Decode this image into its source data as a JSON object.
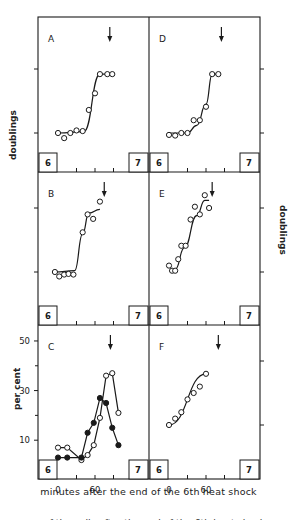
{
  "figure": {
    "y_label_left_top": "doublings",
    "y_label_right": "doublings",
    "y_label_left_bottom": "per cent",
    "x_axis_title": "minutes after the end of the 6th heat shock",
    "caption_fragment": "...rs of the cells after the end of the 6th heat shock..."
  },
  "chart_data": [
    {
      "panel": "A",
      "type": "scatter",
      "col": 0,
      "row": 0,
      "ylabel": "doublings",
      "interval_start_label": "6",
      "interval_end_label": "7",
      "arrow_x": 84,
      "series": [
        {
          "name": "open",
          "marker": "open",
          "points": [
            [
              0,
              0
            ],
            [
              10,
              -0.08
            ],
            [
              20,
              0
            ],
            [
              30,
              0.04
            ],
            [
              40,
              0.03
            ],
            [
              50,
              0.36
            ],
            [
              60,
              0.62
            ],
            [
              68,
              0.92
            ],
            [
              80,
              0.92
            ],
            [
              88,
              0.92
            ]
          ],
          "curve": [
            [
              0,
              0
            ],
            [
              42,
              0.02
            ],
            [
              68,
              0.92
            ],
            [
              88,
              0.92
            ]
          ]
        }
      ],
      "yticks_doublings": [
        0,
        1
      ]
    },
    {
      "panel": "D",
      "type": "scatter",
      "col": 1,
      "row": 0,
      "ylabel": "doublings",
      "interval_start_label": "6",
      "interval_end_label": "7",
      "arrow_x": 85,
      "series": [
        {
          "name": "open",
          "marker": "open",
          "points": [
            [
              0,
              -0.03
            ],
            [
              10,
              -0.04
            ],
            [
              20,
              0
            ],
            [
              30,
              0
            ],
            [
              40,
              0.2
            ],
            [
              50,
              0.2
            ],
            [
              60,
              0.41
            ],
            [
              70,
              0.92
            ],
            [
              80,
              0.92
            ]
          ],
          "curve": [
            [
              0,
              0
            ],
            [
              30,
              0
            ],
            [
              45,
              0.12
            ],
            [
              60,
              0.45
            ],
            [
              70,
              0.92
            ],
            [
              80,
              0.92
            ]
          ]
        }
      ]
    },
    {
      "panel": "B",
      "type": "scatter",
      "col": 0,
      "row": 1,
      "ylabel": "doublings",
      "interval_start_label": "6",
      "interval_end_label": "7",
      "arrow_x": 75,
      "series": [
        {
          "name": "open",
          "marker": "open",
          "points": [
            [
              -5,
              0
            ],
            [
              2,
              -0.07
            ],
            [
              10,
              -0.04
            ],
            [
              17,
              -0.03
            ],
            [
              25,
              -0.04
            ],
            [
              40,
              0.62
            ],
            [
              48,
              0.9
            ],
            [
              57,
              0.83
            ],
            [
              68,
              1.1
            ]
          ],
          "curve": [
            [
              -5,
              0
            ],
            [
              27,
              0.02
            ],
            [
              40,
              0.6
            ],
            [
              50,
              0.92
            ],
            [
              68,
              0.98
            ]
          ]
        }
      ]
    },
    {
      "panel": "E",
      "type": "scatter",
      "col": 1,
      "row": 1,
      "ylabel": "doublings",
      "interval_start_label": "6",
      "interval_end_label": "7",
      "arrow_x": 70,
      "series": [
        {
          "name": "open",
          "marker": "open",
          "points": [
            [
              0,
              0.1
            ],
            [
              5,
              0.02
            ],
            [
              10,
              0.02
            ],
            [
              15,
              0.2
            ],
            [
              20,
              0.41
            ],
            [
              27,
              0.41
            ],
            [
              35,
              0.82
            ],
            [
              42,
              1.02
            ],
            [
              50,
              0.9
            ],
            [
              58,
              1.2
            ],
            [
              65,
              1.0
            ]
          ],
          "curve": [
            [
              0,
              0.02
            ],
            [
              10,
              0.04
            ],
            [
              25,
              0.38
            ],
            [
              45,
              0.88
            ],
            [
              58,
              1.12
            ],
            [
              65,
              1.12
            ]
          ]
        }
      ]
    },
    {
      "panel": "C",
      "type": "line",
      "col": 0,
      "row": 2,
      "ylabel": "per cent",
      "interval_start_label": "6",
      "interval_end_label": "7",
      "arrow_x": 85,
      "yticks": [
        10,
        30,
        50
      ],
      "ylim": [
        0,
        54
      ],
      "xticks": [
        0,
        60
      ],
      "xlabel": "minutes after the end of the 6th heat shock",
      "series": [
        {
          "name": "open circles",
          "marker": "open",
          "points": [
            [
              0,
              7
            ],
            [
              15,
              7
            ],
            [
              38,
              2
            ],
            [
              48,
              4
            ],
            [
              58,
              8
            ],
            [
              68,
              19
            ],
            [
              78,
              36
            ],
            [
              88,
              37
            ],
            [
              98,
              21
            ]
          ]
        },
        {
          "name": "filled circles",
          "marker": "filled",
          "points": [
            [
              0,
              3
            ],
            [
              15,
              3
            ],
            [
              38,
              3
            ],
            [
              48,
              13
            ],
            [
              58,
              17
            ],
            [
              68,
              27
            ],
            [
              78,
              25
            ],
            [
              88,
              15
            ],
            [
              98,
              8
            ]
          ]
        }
      ]
    },
    {
      "panel": "F",
      "type": "line",
      "col": 1,
      "row": 2,
      "ylabel": "doublings",
      "interval_start_label": "6",
      "interval_end_label": "7",
      "arrow_x": 80,
      "xticks": [
        0,
        60
      ],
      "series": [
        {
          "name": "open",
          "marker": "open",
          "points": [
            [
              0,
              0
            ],
            [
              10,
              0.1
            ],
            [
              20,
              0.2
            ],
            [
              30,
              0.4
            ],
            [
              40,
              0.5
            ],
            [
              50,
              0.6
            ],
            [
              60,
              0.8
            ]
          ],
          "curve": [
            [
              0,
              0
            ],
            [
              60,
              0.8
            ]
          ]
        }
      ]
    }
  ]
}
